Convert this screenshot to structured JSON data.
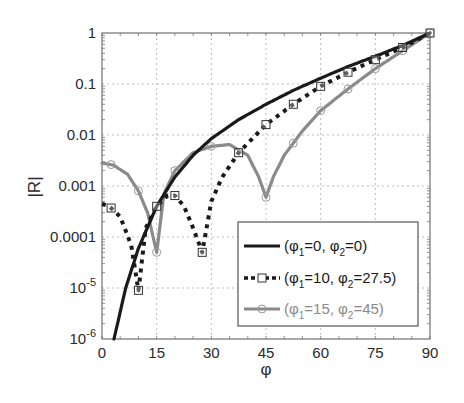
{
  "chart_data": {
    "type": "line",
    "title": "",
    "xlabel": "φ",
    "ylabel": "|R|",
    "xlim": [
      0,
      90
    ],
    "ylim": [
      1e-06,
      1
    ],
    "yscale": "log",
    "grid": true,
    "legend_position": "lower right",
    "xticks": [
      "0",
      "15",
      "30",
      "45",
      "60",
      "75",
      "90"
    ],
    "yticks": [
      {
        "value": 1,
        "label": "1"
      },
      {
        "value": 0.1,
        "label": "0.1"
      },
      {
        "value": 0.01,
        "label": "0.01"
      },
      {
        "value": 0.001,
        "label": "0.001"
      },
      {
        "value": 0.0001,
        "label": "0.0001"
      },
      {
        "value": 1e-05,
        "label": "10",
        "exp": "-5"
      },
      {
        "value": 1e-06,
        "label": "10",
        "exp": "-6"
      }
    ],
    "series": [
      {
        "name": "(φ1=0, φ2=0)",
        "legend": {
          "open": "(φ",
          "s1": "1",
          "mid": "=0, φ",
          "s2": "2",
          "close": "=0)"
        },
        "color": "#1a1a1a",
        "style": "solid",
        "marker": "none",
        "x": [
          3.3,
          6.5,
          10,
          15,
          20,
          25,
          30,
          37.5,
          45,
          52.5,
          60,
          67.5,
          75,
          82.5,
          90
        ],
        "y": [
          1e-06,
          1e-05,
          6e-05,
          0.0004,
          0.0015,
          0.004,
          0.0085,
          0.02,
          0.04,
          0.075,
          0.13,
          0.22,
          0.35,
          0.57,
          1
        ]
      },
      {
        "name": "(φ1=10, φ2=27.5)",
        "legend": {
          "open": "(φ",
          "s1": "1",
          "mid": "=10, φ",
          "s2": "2",
          "close": "=27.5)"
        },
        "color": "#1a1a1a",
        "style": "dashed",
        "marker": "square",
        "x": [
          0,
          2,
          5,
          8,
          10,
          12,
          15,
          18,
          20,
          22.5,
          25,
          27.5,
          30,
          33,
          37.5,
          45,
          52.5,
          60,
          67.5,
          75,
          82.5,
          90
        ],
        "y": [
          0.00045,
          0.0004,
          0.00025,
          7e-05,
          9e-06,
          0.00015,
          0.0004,
          0.00065,
          0.00065,
          0.0004,
          0.00015,
          5e-05,
          0.0005,
          0.0015,
          0.0045,
          0.016,
          0.04,
          0.09,
          0.17,
          0.3,
          0.52,
          1
        ],
        "marker_x": [
          2.5,
          10,
          15,
          20,
          27.5,
          37.5,
          45,
          52.5,
          60,
          67.5,
          75,
          82.5,
          90
        ]
      },
      {
        "name": "(φ1=15, φ2=45)",
        "legend": {
          "open": "(φ",
          "s1": "1",
          "mid": "=15, φ",
          "s2": "2",
          "close": "=45)"
        },
        "color": "#8a8a8a",
        "style": "solid",
        "marker": "circle",
        "x": [
          0,
          3,
          7,
          10,
          12.5,
          15,
          17,
          20,
          25,
          30,
          35,
          40,
          43,
          45,
          47,
          50,
          55,
          60,
          67.5,
          75,
          82.5,
          90
        ],
        "y": [
          0.0028,
          0.0026,
          0.0017,
          0.0008,
          0.0003,
          5e-05,
          0.0007,
          0.002,
          0.0045,
          0.006,
          0.0065,
          0.004,
          0.0015,
          0.0006,
          0.0015,
          0.004,
          0.012,
          0.03,
          0.08,
          0.2,
          0.45,
          1
        ],
        "marker_x": [
          2.5,
          10,
          15,
          20,
          30,
          45,
          52.5,
          60,
          67.5,
          75,
          82.5,
          90
        ]
      }
    ]
  }
}
